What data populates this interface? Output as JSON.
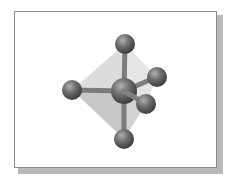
{
  "figure": {
    "type": "molecular-geometry",
    "geometry": "trigonal bipyramidal",
    "colors": {
      "frame_border": "#8a8a8a",
      "frame_shadow": "#b8b8b8",
      "background": "#ffffff",
      "atom_light": "#a8a8a8",
      "atom_mid": "#6c6c6c",
      "atom_dark": "#3e3e3e",
      "bond": "#7c7c7c",
      "polyhedron_light": "#d9d9d9",
      "polyhedron_dark": "#bdbdbd"
    },
    "central_atom": {
      "x": 124,
      "y": 91,
      "r": 13
    },
    "ligands": [
      {
        "id": "axial-top",
        "x": 125,
        "y": 44,
        "r": 10
      },
      {
        "id": "axial-bottom",
        "x": 124,
        "y": 139,
        "r": 10
      },
      {
        "id": "equatorial-left",
        "x": 72,
        "y": 90,
        "r": 10
      },
      {
        "id": "equatorial-back-right",
        "x": 157,
        "y": 77,
        "r": 10
      },
      {
        "id": "equatorial-front-right",
        "x": 146,
        "y": 104,
        "r": 10
      }
    ]
  }
}
